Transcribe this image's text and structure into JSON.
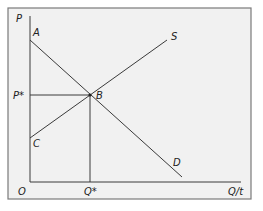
{
  "diagram": {
    "type": "supply-demand",
    "axes": {
      "y_label": "P",
      "x_label": "Q/t",
      "origin_label": "O"
    },
    "curves": {
      "demand": {
        "label": "D",
        "start_label": "A"
      },
      "supply": {
        "label": "S",
        "start_label": "C"
      }
    },
    "equilibrium": {
      "point_label": "B",
      "price_label": "P*",
      "quantity_label": "Q*"
    },
    "colors": {
      "background": "#f1f1f1",
      "frame": "#7a7a7a",
      "lines": "#3a3a3a"
    }
  }
}
